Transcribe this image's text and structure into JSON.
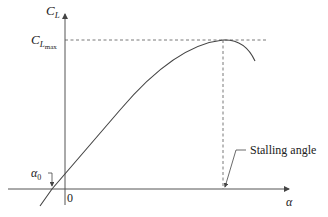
{
  "diagram": {
    "title": "",
    "y_axis_label": "C",
    "y_axis_sub": "L",
    "cmax_label": "C",
    "cmax_sub": "L",
    "cmax_subsub": "max",
    "x_axis_label": "α",
    "origin_label": "0",
    "alpha0_label": "α",
    "alpha0_sub": "0",
    "stall_label": "Stalling angle",
    "line_color": "#444444"
  }
}
